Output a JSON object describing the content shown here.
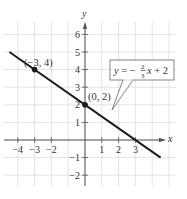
{
  "chart_data": {
    "type": "line",
    "title": "",
    "xlabel": "x",
    "ylabel": "y",
    "xlim": [
      -4.9,
      5.3
    ],
    "ylim": [
      -2.6,
      6.6
    ],
    "grid": true,
    "x_ticks": [
      -4,
      -3,
      -2,
      1,
      2,
      3
    ],
    "y_ticks": [
      -2,
      -1,
      1,
      2,
      3,
      4,
      5,
      6
    ],
    "series": [
      {
        "name": "y = -2/3 x + 2",
        "equation": {
          "slope_num": 2,
          "slope_den": 3,
          "sign": "-",
          "intercept": 2
        },
        "x_start": -4.5,
        "x_end": 4.5,
        "color": "#1a1a1a"
      }
    ],
    "points": [
      {
        "x": -3,
        "y": 4,
        "label": "(−3, 4)"
      },
      {
        "x": 0,
        "y": 2,
        "label": "(0, 2)"
      }
    ],
    "annotations": [
      {
        "type": "callout",
        "text_prefix": "y = −",
        "frac_num": "2",
        "frac_den": "3",
        "text_suffix": "x + 2"
      }
    ]
  },
  "labels": {
    "x_axis": "x",
    "y_axis": "y",
    "point_a": "(−3, 4)",
    "point_b": "(0, 2)",
    "eq_y": "y",
    "eq_eq_minus": " = −",
    "eq_num": "2",
    "eq_den": "3",
    "eq_x": "x",
    "eq_plus": " + 2"
  },
  "colors": {
    "grid": "#d9d9d9",
    "axis": "#555555",
    "line": "#1a1a1a",
    "text": "#333333"
  }
}
